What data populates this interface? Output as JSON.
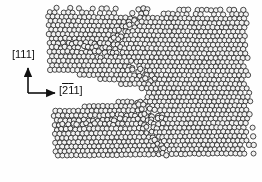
{
  "figure": {
    "type": "atomistic-simulation-snapshot",
    "background_color": "#fefefe",
    "width": 262,
    "height": 182
  },
  "axes": {
    "name": "crystallographic-direction-axes",
    "color": "#111111",
    "origin": {
      "x": 28,
      "y": 93
    },
    "vertical": {
      "label": "[111]",
      "label_plain": "111",
      "overbars": [],
      "length": 27,
      "direction": "up"
    },
    "horizontal": {
      "label": "[211]",
      "label_plain": "211",
      "overbars": [
        0,
        1
      ],
      "length": 29,
      "direction": "right"
    }
  },
  "atoms": {
    "marker": "open-circle",
    "fill_color": "#f2f2f2",
    "stroke_color": "#2a2a2a",
    "radius": 2.6,
    "columns": 44,
    "rows": 34,
    "lattice": {
      "a_x": 4.55,
      "a_y": 4.35,
      "row_offset_x": 2.28,
      "shear_per_row": 0.26,
      "origin_x": 47,
      "origin_y": 10
    },
    "count_estimate": 1420
  },
  "crack": {
    "name": "crack-void",
    "mouth_x": 44,
    "tip_x": 148,
    "center_y": 90,
    "mouth_half_height": 19,
    "tip_half_height": 3,
    "blunting": "wedge-blunted",
    "fill_color": "#ffffff"
  },
  "defects": {
    "slip_bands": [
      {
        "name": "upper-slip-band",
        "x1": 104,
        "y1": 56,
        "x2": 140,
        "y2": 14,
        "width": 9,
        "intensity": 0.85
      },
      {
        "name": "upper-left-disorder",
        "x1": 62,
        "y1": 44,
        "x2": 118,
        "y2": 52,
        "width": 11,
        "intensity": 0.6
      },
      {
        "name": "tip-ledge-upper",
        "x1": 132,
        "y1": 66,
        "x2": 152,
        "y2": 80,
        "width": 8,
        "intensity": 0.9
      },
      {
        "name": "tip-ledge-lower",
        "x1": 136,
        "y1": 100,
        "x2": 160,
        "y2": 120,
        "width": 8,
        "intensity": 0.9
      },
      {
        "name": "lower-slip-band",
        "x1": 140,
        "y1": 112,
        "x2": 168,
        "y2": 160,
        "width": 9,
        "intensity": 0.8
      },
      {
        "name": "lower-left-disorder",
        "x1": 60,
        "y1": 126,
        "x2": 128,
        "y2": 118,
        "width": 10,
        "intensity": 0.55
      }
    ]
  }
}
